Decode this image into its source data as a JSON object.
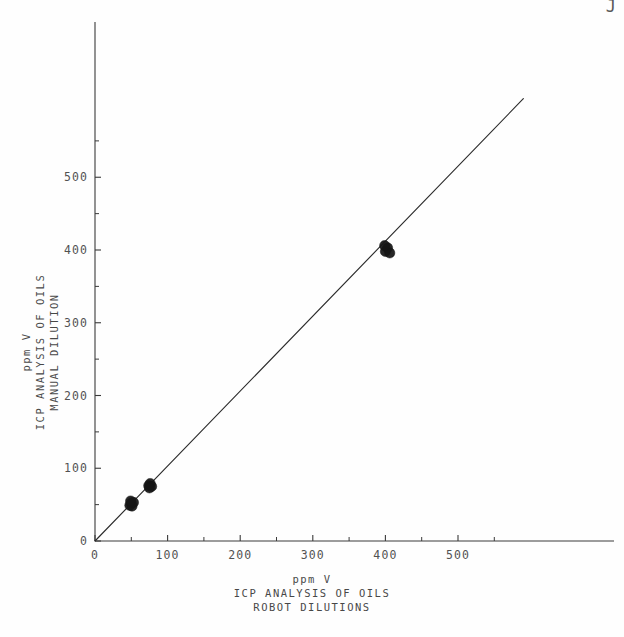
{
  "chart_data": {
    "type": "scatter",
    "title": "",
    "subtitle": "",
    "xlabel": "ppm V\nICP ANALYSIS OF OILS\nROBOT DILUTIONS",
    "ylabel": "ppm V\nICP ANALYSIS OF OILS\nMANUAL DILUTION",
    "xlim": [
      0,
      600
    ],
    "ylim": [
      0,
      625
    ],
    "grid": false,
    "legend": null,
    "x_ticks_major": [
      0,
      100,
      200,
      300,
      400,
      500
    ],
    "y_ticks_major": [
      0,
      100,
      200,
      300,
      400,
      500
    ],
    "x_ticks_minor": [
      50,
      150,
      250,
      350,
      450,
      550
    ],
    "y_ticks_minor": [
      50,
      150,
      250,
      350,
      450,
      550
    ],
    "x_tick_labels": [
      "0",
      "100",
      "200",
      "300",
      "400",
      "500"
    ],
    "y_tick_labels": [
      "0",
      "100",
      "200",
      "300",
      "400",
      "500"
    ],
    "series": [
      {
        "name": "oil samples",
        "marker": "filled-circle",
        "color": "#151515",
        "points": [
          [
            48,
            49
          ],
          [
            50,
            52
          ],
          [
            51,
            48
          ],
          [
            53,
            53
          ],
          [
            49,
            55
          ],
          [
            74,
            76
          ],
          [
            76,
            79
          ],
          [
            78,
            75
          ],
          [
            75,
            73
          ],
          [
            400,
            398
          ],
          [
            403,
            403
          ],
          [
            406,
            396
          ],
          [
            399,
            406
          ]
        ]
      },
      {
        "name": "identity line",
        "marker": "line",
        "color": "#2b2b2b",
        "line_from": [
          0,
          0
        ],
        "line_to": [
          590,
          608
        ]
      }
    ],
    "annotations": [
      {
        "text": "J",
        "position": "top-right-corner"
      }
    ]
  },
  "axes": {
    "x_title_lines": [
      "ppm V",
      "ICP ANALYSIS OF OILS",
      "ROBOT DILUTIONS"
    ],
    "y_title_lines": [
      "ppm V",
      "ICP ANALYSIS OF OILS",
      "MANUAL DILUTION"
    ]
  },
  "colors": {
    "background": "#ffffff",
    "axis": "#3a3a3a",
    "marker": "#151515",
    "line": "#2b2b2b",
    "text": "#343434"
  }
}
